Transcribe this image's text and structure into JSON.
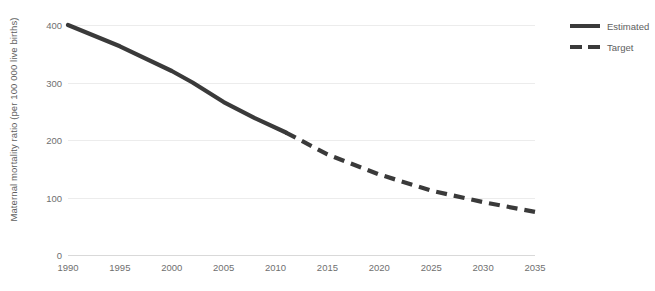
{
  "chart_data": {
    "type": "line",
    "title": "",
    "subtitle": "",
    "xlabel": "",
    "ylabel": "Maternal mortality ratio (per 100 000  live births)",
    "xlim": [
      1990,
      2035
    ],
    "ylim": [
      0,
      400
    ],
    "xticks": [
      "1990",
      "1995",
      "2000",
      "2005",
      "2010",
      "2015",
      "2020",
      "2025",
      "2030",
      "2035"
    ],
    "yticks": [
      "0",
      "100",
      "200",
      "300",
      "400"
    ],
    "grid": "horizontal",
    "legend_position": "top-right",
    "line_color": "#3a3a3a",
    "gridline_color": "#ececec",
    "series": [
      {
        "name": "Estimated",
        "style": "solid",
        "color": "#3a3a3a",
        "x": [
          1990,
          1995,
          2000,
          2002,
          2005,
          2008,
          2011
        ],
        "values": [
          400,
          363,
          320,
          300,
          266,
          238,
          213
        ]
      },
      {
        "name": "Target",
        "style": "dashed",
        "color": "#3a3a3a",
        "x": [
          2011,
          2015,
          2020,
          2025,
          2030,
          2035
        ],
        "values": [
          213,
          175,
          140,
          112,
          92,
          75
        ]
      }
    ]
  },
  "legend": {
    "items": [
      {
        "label": "Estimated",
        "style": "solid"
      },
      {
        "label": "Target",
        "style": "dashed"
      }
    ]
  },
  "axes": {
    "y_title": "Maternal mortality ratio (per 100 000  live births)"
  }
}
